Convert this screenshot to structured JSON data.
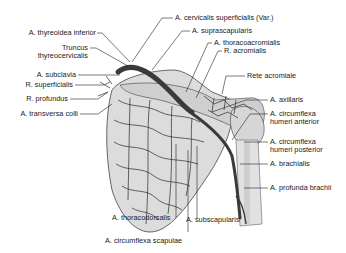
{
  "figure": {
    "colors": {
      "artery_main": "#3a3a3a",
      "artery_branch": "#2a2a2a",
      "bone_fill": "#d9d9d9",
      "bone_shadow": "#bdbdbd",
      "leader_line": "#222222",
      "text": "#1a1a1a"
    }
  },
  "labels_left": [
    {
      "id": "thyreoidea-inferior",
      "text": "A. thyreoidea inferior"
    },
    {
      "id": "truncus-1",
      "text": "Truncus"
    },
    {
      "id": "truncus-2",
      "text": "thyreocervicalis"
    },
    {
      "id": "subclavia",
      "text": "A. subclavia"
    },
    {
      "id": "r-superficialis",
      "text": "R. superficialis"
    },
    {
      "id": "r-profundus",
      "text": "R. profundus"
    },
    {
      "id": "transversa-colli",
      "text": "A. transversa colli"
    }
  ],
  "labels_top": [
    {
      "id": "cervicalis-superficialis",
      "text": "A. cervicalis superficialis (Var.)"
    },
    {
      "id": "suprascapularis",
      "text": "A. suprascapularis"
    },
    {
      "id": "thoracoacromialis",
      "text": "A. thoracoacromialis"
    },
    {
      "id": "r-acromialis",
      "text": "R. acromialis"
    }
  ],
  "labels_right": [
    {
      "id": "rete-acromiale",
      "text": "Rete acromiale"
    },
    {
      "id": "axillaris",
      "text": "A. axillaris"
    },
    {
      "id": "chumeri-ant-1",
      "text": "A. circumflexa"
    },
    {
      "id": "chumeri-ant-2",
      "text": "humeri anterior"
    },
    {
      "id": "chumeri-post-1",
      "text": "A. circumflexa"
    },
    {
      "id": "chumeri-post-2",
      "text": "humeri posterior"
    },
    {
      "id": "brachialis",
      "text": "A. brachialis"
    },
    {
      "id": "profunda-brachii",
      "text": "A. profunda brachii"
    }
  ],
  "labels_bottom": [
    {
      "id": "subscapularis",
      "text": "A. subscapularis"
    },
    {
      "id": "thoracodorsalis",
      "text": "A. thoracodorsalis"
    },
    {
      "id": "circumflexa-scapulae",
      "text": "A. circumflexa scapulae"
    }
  ]
}
